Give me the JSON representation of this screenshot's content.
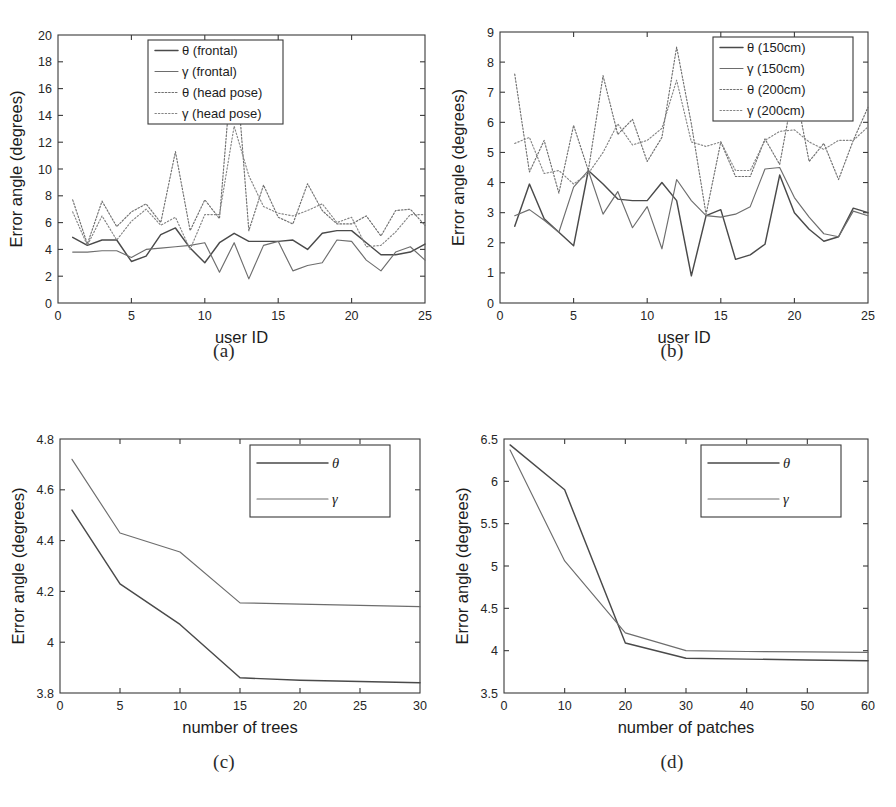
{
  "figure": {
    "panels": [
      {
        "id": "a",
        "caption": "(a)"
      },
      {
        "id": "b",
        "caption": "(b)"
      },
      {
        "id": "c",
        "caption": "(c)"
      },
      {
        "id": "d",
        "caption": "(d)"
      }
    ]
  },
  "chart_data": [
    {
      "panel": "a",
      "type": "line",
      "title": "",
      "xlabel": "user ID",
      "ylabel": "Error angle (degrees)",
      "xlim": [
        0,
        25
      ],
      "ylim": [
        0,
        20
      ],
      "xticks": [
        0,
        5,
        10,
        15,
        20,
        25
      ],
      "yticks": [
        0,
        2,
        4,
        6,
        8,
        10,
        12,
        14,
        16,
        18,
        20
      ],
      "xticklabels": [
        "0",
        "5",
        "10",
        "15",
        "20",
        "25"
      ],
      "yticklabels": [
        "0",
        "2",
        "4",
        "6",
        "8",
        "10",
        "12",
        "14",
        "16",
        "18",
        "20"
      ],
      "grid": false,
      "legend_position": "top-center",
      "x": [
        1,
        2,
        3,
        4,
        5,
        6,
        7,
        8,
        9,
        10,
        11,
        12,
        13,
        14,
        15,
        16,
        17,
        18,
        19,
        20,
        21,
        22,
        23,
        24,
        25
      ],
      "series": [
        {
          "name": "θ (frontal)",
          "style": "solid",
          "values": [
            4.9,
            4.3,
            4.7,
            4.7,
            3.1,
            3.5,
            5.1,
            5.6,
            4.1,
            3.0,
            4.5,
            5.2,
            4.6,
            4.6,
            4.6,
            4.7,
            4.0,
            5.2,
            5.4,
            5.4,
            4.5,
            3.6,
            3.6,
            3.8,
            4.4
          ]
        },
        {
          "name": "γ (frontal)",
          "style": "solid",
          "values": [
            3.8,
            3.8,
            3.9,
            3.9,
            3.4,
            4.0,
            4.1,
            4.2,
            4.3,
            4.5,
            2.3,
            4.5,
            1.8,
            4.3,
            4.6,
            2.4,
            2.8,
            3.0,
            4.7,
            4.6,
            3.2,
            2.4,
            3.8,
            4.2,
            3.2
          ]
        },
        {
          "name": "θ (head pose)",
          "style": "dotted",
          "values": [
            7.7,
            4.4,
            7.6,
            5.7,
            6.8,
            7.4,
            6.0,
            11.3,
            5.4,
            7.7,
            6.3,
            19.6,
            5.4,
            8.8,
            6.4,
            5.9,
            8.9,
            6.9,
            5.9,
            5.9,
            6.5,
            5.0,
            6.9,
            7.0,
            5.8
          ]
        },
        {
          "name": "γ (head pose)",
          "style": "dotted",
          "values": [
            6.8,
            4.3,
            6.5,
            4.7,
            6.1,
            7.0,
            5.8,
            6.4,
            4.0,
            6.6,
            6.6,
            13.2,
            9.5,
            7.2,
            6.7,
            6.5,
            6.9,
            7.4,
            6.0,
            6.4,
            4.2,
            4.3,
            5.3,
            6.6,
            6.6
          ]
        }
      ]
    },
    {
      "panel": "b",
      "type": "line",
      "title": "",
      "xlabel": "user ID",
      "ylabel": "Error angle (degrees)",
      "xlim": [
        0,
        25
      ],
      "ylim": [
        0,
        9
      ],
      "xticks": [
        0,
        5,
        10,
        15,
        20,
        25
      ],
      "yticks": [
        0,
        1,
        2,
        3,
        4,
        5,
        6,
        7,
        8,
        9
      ],
      "xticklabels": [
        "0",
        "5",
        "10",
        "15",
        "20",
        "25"
      ],
      "yticklabels": [
        "0",
        "1",
        "2",
        "3",
        "4",
        "5",
        "6",
        "7",
        "8",
        "9"
      ],
      "grid": false,
      "legend_position": "top-right",
      "x": [
        1,
        2,
        3,
        4,
        5,
        6,
        7,
        8,
        9,
        10,
        11,
        12,
        13,
        14,
        15,
        16,
        17,
        18,
        19,
        20,
        21,
        22,
        23,
        24,
        25
      ],
      "series": [
        {
          "name": "θ (150cm)",
          "style": "solid",
          "values": [
            2.55,
            3.95,
            2.8,
            2.35,
            1.9,
            4.4,
            3.95,
            3.45,
            3.4,
            3.4,
            4.0,
            3.4,
            0.9,
            2.9,
            3.1,
            1.45,
            1.6,
            1.95,
            4.25,
            3.0,
            2.45,
            2.05,
            2.2,
            3.15,
            3.0
          ]
        },
        {
          "name": "γ (150cm)",
          "style": "solid",
          "values": [
            2.9,
            3.1,
            2.75,
            2.35,
            3.85,
            4.4,
            2.95,
            3.7,
            2.5,
            3.2,
            1.8,
            4.1,
            3.4,
            2.9,
            2.85,
            2.95,
            3.2,
            4.45,
            4.5,
            3.5,
            2.85,
            2.3,
            2.2,
            3.05,
            2.9
          ]
        },
        {
          "name": "θ (200cm)",
          "style": "dotted",
          "values": [
            7.6,
            4.35,
            5.4,
            3.65,
            5.9,
            4.4,
            7.55,
            5.6,
            6.1,
            4.7,
            5.5,
            8.5,
            5.95,
            2.95,
            5.35,
            4.2,
            4.2,
            5.45,
            4.6,
            7.25,
            4.7,
            5.3,
            4.1,
            5.4,
            6.5
          ]
        },
        {
          "name": "γ (200cm)",
          "style": "dotted",
          "values": [
            5.3,
            5.5,
            4.3,
            4.4,
            3.95,
            4.3,
            5.0,
            5.95,
            5.25,
            5.4,
            5.8,
            7.4,
            5.35,
            5.2,
            5.35,
            4.4,
            4.4,
            5.4,
            5.7,
            5.75,
            5.35,
            5.1,
            5.4,
            5.4,
            5.85
          ]
        }
      ]
    },
    {
      "panel": "c",
      "type": "line",
      "title": "",
      "xlabel": "number of trees",
      "ylabel": "Error angle (degrees)",
      "xlim": [
        0,
        30
      ],
      "ylim": [
        3.8,
        4.8
      ],
      "xticks": [
        0,
        5,
        10,
        15,
        20,
        25,
        30
      ],
      "yticks": [
        3.8,
        4.0,
        4.2,
        4.4,
        4.6,
        4.8
      ],
      "xticklabels": [
        "0",
        "5",
        "10",
        "15",
        "20",
        "25",
        "30"
      ],
      "yticklabels": [
        "3.8",
        "4",
        "4.2",
        "4.4",
        "4.6",
        "4.8"
      ],
      "grid": false,
      "legend_position": "top-right",
      "x": [
        1,
        5,
        10,
        15,
        20,
        25,
        30
      ],
      "series": [
        {
          "name": "θ",
          "style": "solid",
          "values": [
            4.52,
            4.23,
            4.07,
            3.86,
            3.85,
            3.845,
            3.84
          ]
        },
        {
          "name": "γ",
          "style": "solid",
          "values": [
            4.72,
            4.43,
            4.355,
            4.155,
            4.15,
            4.145,
            4.14
          ]
        }
      ]
    },
    {
      "panel": "d",
      "type": "line",
      "title": "",
      "xlabel": "number of patches",
      "ylabel": "Error angle (degrees)",
      "xlim": [
        0,
        60
      ],
      "ylim": [
        3.5,
        6.5
      ],
      "xticks": [
        0,
        10,
        20,
        30,
        40,
        50,
        60
      ],
      "yticks": [
        3.5,
        4.0,
        4.5,
        5.0,
        5.5,
        6.0,
        6.5
      ],
      "xticklabels": [
        "0",
        "10",
        "20",
        "30",
        "40",
        "50",
        "60"
      ],
      "yticklabels": [
        "3.5",
        "4",
        "4.5",
        "5",
        "5.5",
        "6",
        "6.5"
      ],
      "grid": false,
      "legend_position": "top-right",
      "x": [
        1,
        10,
        20,
        30,
        40,
        50,
        60
      ],
      "series": [
        {
          "name": "θ",
          "style": "solid",
          "values": [
            6.43,
            5.9,
            4.09,
            3.91,
            3.9,
            3.89,
            3.88
          ]
        },
        {
          "name": "γ",
          "style": "solid",
          "values": [
            6.37,
            5.06,
            4.21,
            4.0,
            3.99,
            3.985,
            3.98
          ]
        }
      ]
    }
  ]
}
